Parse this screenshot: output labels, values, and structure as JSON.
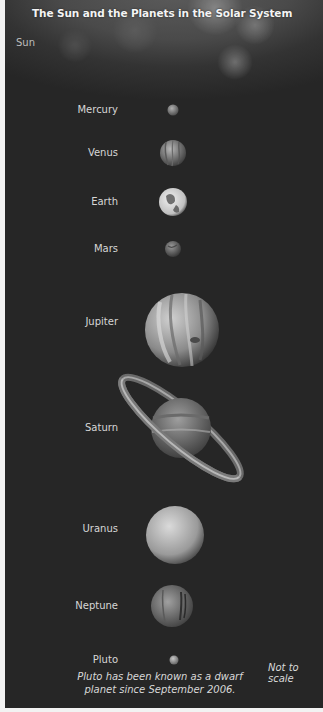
{
  "title": "The Sun and the Planets in the Solar System",
  "sun_label": "Sun",
  "planets": [
    {
      "name": "Mercury",
      "color": "#8a8a8a"
    },
    {
      "name": "Venus",
      "color": "#9a9a9a"
    },
    {
      "name": "Earth",
      "color": "#d8d8d8"
    },
    {
      "name": "Mars",
      "color": "#7a7a7a"
    },
    {
      "name": "Jupiter",
      "color": "#a8a8a8"
    },
    {
      "name": "Saturn",
      "color": "#8e8e8e"
    },
    {
      "name": "Uranus",
      "color": "#b5b5b5"
    },
    {
      "name": "Neptune",
      "color": "#8c8c8c"
    },
    {
      "name": "Pluto",
      "color": "#9a9a9a"
    }
  ],
  "not_to_scale": "Not to scale",
  "caption_line1": "Pluto has been known as a dwarf",
  "caption_line2": "planet since September 2006."
}
